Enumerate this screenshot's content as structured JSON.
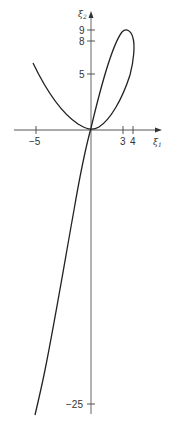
{
  "figure": {
    "x_axis_label": "ξ",
    "x_axis_sub": "1",
    "y_axis_label": "ξ",
    "y_axis_sub": "2",
    "x_ticks": [
      {
        "value": -5,
        "label": "−5"
      },
      {
        "value": 3,
        "label": "3"
      },
      {
        "value": 4,
        "label": "4"
      }
    ],
    "y_ticks": [
      {
        "value": 9,
        "label": "9"
      },
      {
        "value": 8,
        "label": "8"
      },
      {
        "value": 5,
        "label": "5"
      },
      {
        "value": -25,
        "label": "−25"
      }
    ],
    "curves": [
      {
        "name": "parabola-branch",
        "description": "U-shaped curve from (-5, ~6) down to origin, rising into a loop reaching max ξ2≈9 near ξ1≈3.5 and max ξ1≈4"
      },
      {
        "name": "steep-branch",
        "description": "Near-linear curve through origin, rising to loop top and descending steeply to ξ2≈-28 at ξ1≈-5"
      }
    ],
    "line_color": "#222222"
  }
}
